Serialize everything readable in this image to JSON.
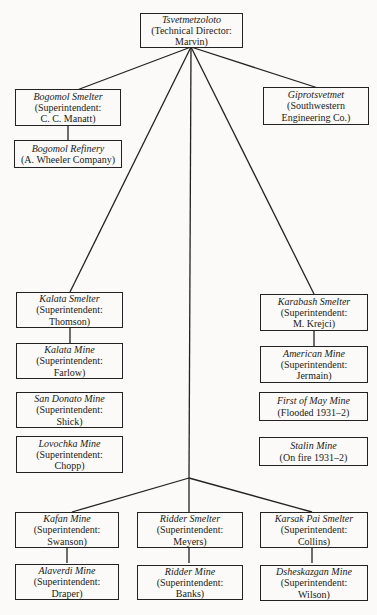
{
  "diagram": {
    "type": "org-chart",
    "root": {
      "id": "tsvetmetzoloto",
      "title": "Tsvetmetzoloto",
      "subtitle": "(Technical Director:\nMarvin)"
    },
    "nodes": {
      "bogomol_smelter": {
        "title": "Bogomol Smelter",
        "subtitle": "(Superintendent:\nC. C. Manatt)"
      },
      "bogomol_refinery": {
        "title": "Bogomol Refinery",
        "subtitle": "(A. Wheeler Company)"
      },
      "giprotsvetmet": {
        "title": "Giprotsvetmet",
        "subtitle": "(Southwestern\nEngineering Co.)"
      },
      "kalata_smelter": {
        "title": "Kalata Smelter",
        "subtitle": "(Superintendent:\nThomson)"
      },
      "kalata_mine": {
        "title": "Kalata Mine",
        "subtitle": "(Superintendent:\nFarlow)"
      },
      "san_donato_mine": {
        "title": "San Donato Mine",
        "subtitle": "(Superintendent:\nShick)"
      },
      "lovochka_mine": {
        "title": "Lovochka Mine",
        "subtitle": "(Superintendent:\nChopp)"
      },
      "karabash_smelter": {
        "title": "Karabash Smelter",
        "subtitle": "(Superintendent:\nM. Krejci)"
      },
      "american_mine": {
        "title": "American Mine",
        "subtitle": "(Superintendent:\nJermain)"
      },
      "first_of_may_mine": {
        "title": "First of May Mine",
        "subtitle": "(Flooded 1931–2)"
      },
      "stalin_mine": {
        "title": "Stalin Mine",
        "subtitle": "(On fire 1931–2)"
      },
      "kafan_mine": {
        "title": "Kafan Mine",
        "subtitle": "(Superintendent:\nSwanson)"
      },
      "alaverdi_mine": {
        "title": "Alaverdi Mine",
        "subtitle": "(Superintendent:\nDraper)"
      },
      "ridder_smelter": {
        "title": "Ridder Smelter",
        "subtitle": "(Superintendent:\nMeyers)"
      },
      "ridder_mine": {
        "title": "Ridder Mine",
        "subtitle": "(Superintendent:\nBanks)"
      },
      "karsak_pai_smelter": {
        "title": "Karsak Pai Smelter",
        "subtitle": "(Superintendent:\nCollins)"
      },
      "dsheskazgan_mine": {
        "title": "Dsheskazgan Mine",
        "subtitle": "(Superintendent:\nWilson)"
      }
    },
    "edges": [
      [
        "tsvetmetzoloto",
        "bogomol_smelter"
      ],
      [
        "tsvetmetzoloto",
        "giprotsvetmet"
      ],
      [
        "tsvetmetzoloto",
        "kalata_smelter"
      ],
      [
        "tsvetmetzoloto",
        "karabash_smelter"
      ],
      [
        "tsvetmetzoloto",
        "kafan_mine"
      ],
      [
        "tsvetmetzoloto",
        "ridder_smelter"
      ],
      [
        "tsvetmetzoloto",
        "karsak_pai_smelter"
      ],
      [
        "bogomol_smelter",
        "bogomol_refinery"
      ],
      [
        "kalata_smelter",
        "kalata_mine"
      ],
      [
        "karabash_smelter",
        "american_mine"
      ],
      [
        "kafan_mine",
        "alaverdi_mine"
      ],
      [
        "ridder_smelter",
        "ridder_mine"
      ],
      [
        "karsak_pai_smelter",
        "dsheskazgan_mine"
      ]
    ]
  }
}
